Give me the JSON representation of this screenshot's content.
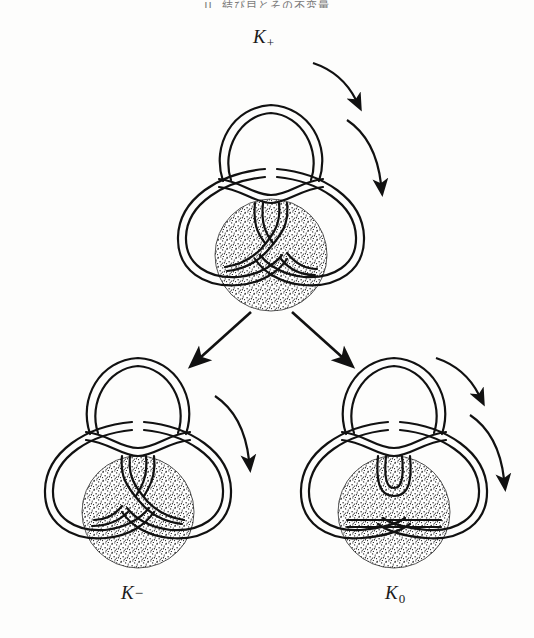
{
  "page": {
    "width": 534,
    "height": 638,
    "background_color": "#fdfdfc",
    "ink_color": "#1a1a1a",
    "header": "II. 結び目とその不変量",
    "figure_kind": "knot-skein-relation-diagram"
  },
  "labels": {
    "k_plus": {
      "base": "K",
      "sub": "+",
      "x": 253,
      "y": 26
    },
    "k_minus": {
      "base": "K",
      "sub": "−",
      "x": 121,
      "y": 582
    },
    "k_zero": {
      "base": "K",
      "sub": "0",
      "x": 385,
      "y": 582
    }
  },
  "diagrams": [
    {
      "name": "k-plus-diagram",
      "label": "K+",
      "crossing": "positive",
      "center": {
        "x": 271,
        "y": 175
      },
      "disk": {
        "cx": 271,
        "cy": 255,
        "r": 56,
        "fill": "stipple"
      },
      "orientation_arrows": 2
    },
    {
      "name": "k-minus-diagram",
      "label": "K−",
      "crossing": "negative",
      "center": {
        "x": 138,
        "y": 470
      },
      "disk": {
        "cx": 138,
        "cy": 512,
        "r": 56,
        "fill": "stipple"
      },
      "orientation_arrows": 1
    },
    {
      "name": "k-zero-diagram",
      "label": "K0",
      "crossing": "smoothed",
      "center": {
        "x": 394,
        "y": 470
      },
      "disk": {
        "cx": 394,
        "cy": 512,
        "r": 56,
        "fill": "stipple"
      },
      "orientation_arrows": 2
    }
  ],
  "transition_arrows": [
    {
      "name": "arrow-to-k-minus",
      "from": {
        "x": 251,
        "y": 312
      },
      "to": {
        "x": 196,
        "y": 362
      },
      "direction": "down-left"
    },
    {
      "name": "arrow-to-k-zero",
      "from": {
        "x": 292,
        "y": 312
      },
      "to": {
        "x": 347,
        "y": 362
      },
      "direction": "down-right"
    }
  ],
  "colors": {
    "ink": "#1a1a1a",
    "paper": "#fdfdfc",
    "stipple": "#2a2a2a",
    "header_text": "#4a4a4a"
  }
}
